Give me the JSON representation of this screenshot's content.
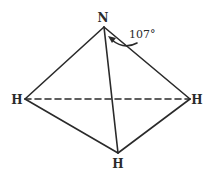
{
  "diagram": {
    "atoms": {
      "apex": "N",
      "left": "H",
      "right": "H",
      "bottom": "H"
    },
    "angle_label": "107°",
    "colors": {
      "line": "#2a2a2a",
      "background": "#ffffff"
    }
  }
}
